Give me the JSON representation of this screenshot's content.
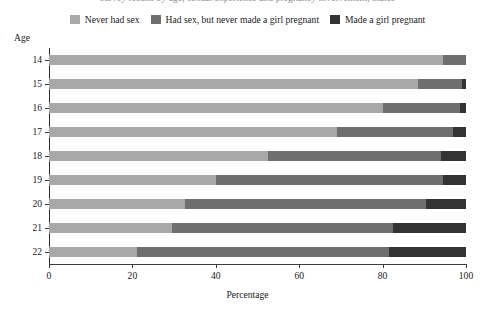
{
  "figure": {
    "cut_title": "survey results by age, sexual experience and pregnancy involvement, males"
  },
  "legend": {
    "position": "top-center",
    "items": [
      {
        "label": "Never had sex",
        "color": "#a8a8a8"
      },
      {
        "label": "Had sex, but never made a girl pregnant",
        "color": "#6e6e6e"
      },
      {
        "label": "Made a girl pregnant",
        "color": "#333333"
      }
    ]
  },
  "axes": {
    "ylabel": "Age",
    "xlabel": "Percentage",
    "xticks": [
      0,
      20,
      40,
      60,
      80,
      100
    ],
    "xlim": [
      0,
      100
    ]
  },
  "chart_data": {
    "type": "bar",
    "orientation": "horizontal",
    "stacked": true,
    "title": "",
    "xlabel": "Percentage",
    "ylabel": "Age",
    "xlim": [
      0,
      100
    ],
    "xticks": [
      0,
      20,
      40,
      60,
      80,
      100
    ],
    "grid": false,
    "legend_position": "top-center",
    "categories": [
      "14",
      "15",
      "16",
      "17",
      "18",
      "19",
      "20",
      "21",
      "22"
    ],
    "series": [
      {
        "name": "Never had sex",
        "color": "#a8a8a8",
        "values": [
          94.5,
          88.5,
          80.0,
          69.0,
          52.5,
          40.0,
          32.5,
          29.5,
          21.0
        ]
      },
      {
        "name": "Had sex, but never made a girl pregnant",
        "color": "#6e6e6e",
        "values": [
          5.5,
          10.5,
          18.5,
          28.0,
          41.5,
          54.5,
          58.0,
          53.0,
          60.5
        ]
      },
      {
        "name": "Made a girl pregnant",
        "color": "#333333",
        "values": [
          0.0,
          1.0,
          1.5,
          3.0,
          6.0,
          5.5,
          9.5,
          17.5,
          18.5
        ]
      }
    ]
  }
}
